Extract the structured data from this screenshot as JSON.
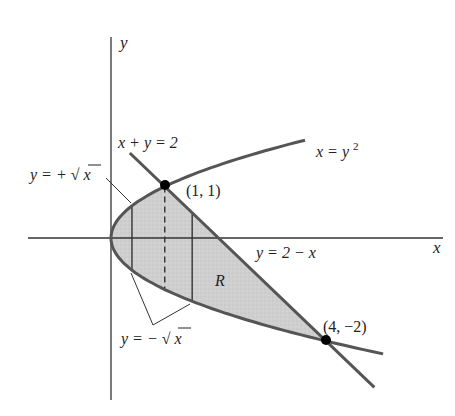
{
  "figure": {
    "type": "region-between-curves",
    "origin_px": [
      111,
      238
    ],
    "scale_px": {
      "x": 53.75,
      "y": 51.5
    },
    "colors": {
      "curve": "#555555",
      "axis": "#333333",
      "fill": "#cfcfcf",
      "point": "#000000",
      "text": "#222222"
    }
  },
  "axes": {
    "x_label": "x",
    "y_label": "y"
  },
  "curves": {
    "parabola": {
      "equation": "x = y²",
      "label_main": "x = y",
      "label_sup": "2"
    },
    "line": {
      "equation": "x + y = 2",
      "label_top": "x + y = 2",
      "label_alt": "y = 2 − x"
    },
    "upper_branch": {
      "label": "y = +√x",
      "pre": "y = +",
      "radical": "√",
      "var": "x"
    },
    "lower_branch": {
      "label": "y = −√x",
      "pre": "y = −",
      "radical": "√",
      "var": "x"
    }
  },
  "points": [
    {
      "label": "(1, 1)",
      "x": 1,
      "y": 1
    },
    {
      "label": "(4, −2)",
      "x": 4,
      "y": -2
    }
  ],
  "region": {
    "label": "R"
  },
  "strips": [
    {
      "x": 0.39,
      "style": "solid"
    },
    {
      "x": 1.0,
      "style": "dashed"
    },
    {
      "x": 1.51,
      "style": "solid"
    }
  ]
}
